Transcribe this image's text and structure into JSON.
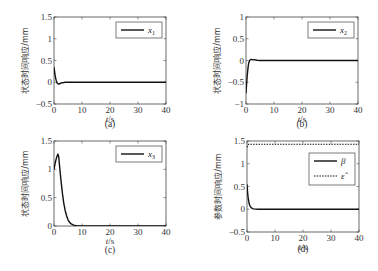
{
  "chart_data": [
    {
      "type": "line",
      "panel": "a",
      "caption": "(a)",
      "xlabel_italic": "t",
      "xlabel_unit": "/s",
      "ylabel": "状态时间响应/mm",
      "xlim": [
        0,
        40
      ],
      "ylim": [
        -0.5,
        1.5
      ],
      "xticks": [
        0,
        10,
        20,
        30,
        40
      ],
      "xtick_labels": [
        "0",
        "10",
        "20",
        "30",
        "40"
      ],
      "yticks": [
        -0.5,
        0,
        0.5,
        1,
        1.5
      ],
      "ytick_labels": [
        "-0.5",
        "0",
        "0.5",
        "1",
        "1.5"
      ],
      "legend": {
        "position": "top-right",
        "entries": [
          {
            "label": "x",
            "sub": "1",
            "style": "solid"
          }
        ]
      },
      "series": [
        {
          "name": "x1",
          "style": "solid",
          "x": [
            0,
            0.2,
            0.4,
            0.6,
            0.8,
            1.0,
            1.3,
            1.6,
            2.0,
            2.4,
            2.8,
            3.2,
            3.6,
            4.0,
            5,
            6,
            8,
            10,
            15,
            20,
            25,
            30,
            35,
            40
          ],
          "y": [
            0.35,
            0.25,
            0.16,
            0.09,
            0.04,
            0.0,
            -0.03,
            -0.04,
            -0.035,
            -0.02,
            -0.01,
            -0.015,
            -0.005,
            0.0,
            0,
            0,
            0,
            0,
            0,
            0,
            0,
            0,
            0,
            0
          ]
        }
      ]
    },
    {
      "type": "line",
      "panel": "b",
      "caption": "(b)",
      "xlabel_italic": "t",
      "xlabel_unit": "/s",
      "ylabel": "状态时间响应/mm",
      "xlim": [
        0,
        40
      ],
      "ylim": [
        -1,
        1
      ],
      "xticks": [
        0,
        10,
        20,
        30,
        40
      ],
      "xtick_labels": [
        "0",
        "10",
        "20",
        "30",
        "40"
      ],
      "yticks": [
        -1,
        -0.5,
        0,
        0.5,
        1
      ],
      "ytick_labels": [
        "-1",
        "-0.5",
        "0",
        "0.5",
        "1"
      ],
      "legend": {
        "position": "top-right",
        "entries": [
          {
            "label": "x",
            "sub": "2",
            "style": "solid"
          }
        ]
      },
      "series": [
        {
          "name": "x2",
          "style": "solid",
          "x": [
            0,
            0.2,
            0.4,
            0.6,
            0.8,
            1.0,
            1.3,
            1.6,
            2.0,
            2.5,
            3.0,
            3.5,
            4.0,
            5,
            6,
            8,
            10,
            15,
            20,
            25,
            30,
            35,
            40
          ],
          "y": [
            -0.75,
            -0.55,
            -0.38,
            -0.24,
            -0.13,
            -0.05,
            0.0,
            0.02,
            0.025,
            0.015,
            0.02,
            0.01,
            0.005,
            0,
            0,
            0,
            0,
            0,
            0,
            0,
            0,
            0,
            0
          ]
        }
      ]
    },
    {
      "type": "line",
      "panel": "c",
      "caption": "(c)",
      "xlabel_italic": "t",
      "xlabel_unit": "/s",
      "ylabel": "状态时间响应/mm",
      "xlim": [
        0,
        40
      ],
      "ylim": [
        0,
        1.5
      ],
      "xticks": [
        0,
        10,
        20,
        30,
        40
      ],
      "xtick_labels": [
        "0",
        "10",
        "20",
        "30",
        "40"
      ],
      "yticks": [
        0,
        0.5,
        1,
        1.5
      ],
      "ytick_labels": [
        "0",
        "0.5",
        "1",
        "1.5"
      ],
      "legend": {
        "position": "top-right",
        "entries": [
          {
            "label": "x",
            "sub": "3",
            "style": "solid"
          }
        ]
      },
      "series": [
        {
          "name": "x3",
          "style": "solid",
          "x": [
            0,
            0.3,
            0.6,
            1.0,
            1.4,
            1.7,
            2.0,
            2.5,
            3.0,
            3.5,
            4.0,
            4.5,
            5.0,
            5.5,
            6.0,
            7.0,
            8.0,
            9.0,
            10,
            15,
            20,
            25,
            30,
            35,
            40
          ],
          "y": [
            1.0,
            1.08,
            1.15,
            1.22,
            1.27,
            1.22,
            1.05,
            0.8,
            0.58,
            0.4,
            0.27,
            0.18,
            0.11,
            0.07,
            0.04,
            0.015,
            0.005,
            0.0,
            0,
            0,
            0,
            0,
            0,
            0,
            0
          ]
        }
      ]
    },
    {
      "type": "line",
      "panel": "d",
      "caption": "(d)",
      "xlabel_italic": "t",
      "xlabel_unit": "/s",
      "ylabel": "参数时间响应/mm",
      "xlim": [
        0,
        40
      ],
      "ylim": [
        -0.5,
        1.5
      ],
      "xticks": [
        0,
        10,
        20,
        30,
        40
      ],
      "xtick_labels": [
        "0",
        "10",
        "20",
        "30",
        "40"
      ],
      "yticks": [
        -0.5,
        0,
        0.5,
        1,
        1.5
      ],
      "ytick_labels": [
        "-0.5",
        "0",
        "0.5",
        "1",
        "1.5"
      ],
      "legend": {
        "position": "top-right",
        "entries": [
          {
            "label": "β",
            "sub": "",
            "style": "solid"
          },
          {
            "label": "ε̂",
            "sub": "",
            "style": "dotted"
          }
        ]
      },
      "series": [
        {
          "name": "beta",
          "style": "solid",
          "x": [
            0,
            0.2,
            0.4,
            0.6,
            0.8,
            1.0,
            1.3,
            1.6,
            2.0,
            2.5,
            3.0,
            4.0,
            5,
            8,
            10,
            15,
            20,
            25,
            30,
            35,
            40
          ],
          "y": [
            0.55,
            0.38,
            0.26,
            0.18,
            0.12,
            0.08,
            0.05,
            0.03,
            0.015,
            0.007,
            0.003,
            0.0,
            0,
            0,
            0,
            0,
            0,
            0,
            0,
            0,
            0
          ]
        },
        {
          "name": "epsilon_hat",
          "style": "dotted",
          "x": [
            0,
            0.3,
            0.6,
            1.0,
            40
          ],
          "y": [
            1.36,
            1.41,
            1.43,
            1.43,
            1.43
          ]
        }
      ]
    }
  ]
}
